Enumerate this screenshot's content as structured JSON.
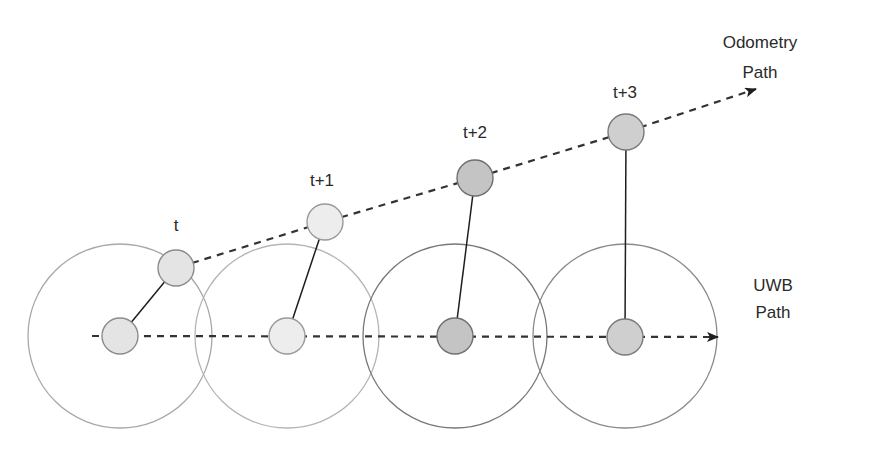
{
  "diagram": {
    "labels": {
      "odometry_line1": "Odometry",
      "odometry_line2": "Path",
      "uwb_line1": "UWB",
      "uwb_line2": "Path"
    },
    "timesteps": [
      {
        "label": "t",
        "odom": [
          176,
          268
        ],
        "uwb": [
          120,
          336
        ],
        "range_circle_stroke": "#a8a8a8",
        "node_fill": "#e4e4e4"
      },
      {
        "label": "t+1",
        "odom": [
          325,
          222
        ],
        "uwb": [
          287,
          336
        ],
        "range_circle_stroke": "#b4b4b4",
        "node_fill": "#ededed"
      },
      {
        "label": "t+2",
        "odom": [
          475,
          178
        ],
        "uwb": [
          455,
          336
        ],
        "range_circle_stroke": "#777777",
        "node_fill": "#c4c4c4"
      },
      {
        "label": "t+3",
        "odom": [
          626,
          132
        ],
        "uwb": [
          625,
          336
        ],
        "range_circle_stroke": "#8a8a8a",
        "node_fill": "#cfcfcf"
      }
    ],
    "range_circle_radius": 92,
    "node_radius": 18,
    "colors": {
      "dash": "#333333",
      "link": "#1e1e1e",
      "node_stroke": "#8c8c8c"
    }
  }
}
